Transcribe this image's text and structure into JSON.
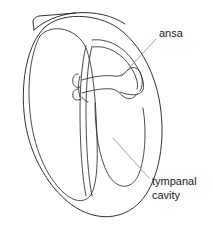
{
  "figure": {
    "name": "tympanal-organ-cross-section",
    "background_color": "#ffffff",
    "ink_color": "#1a1a1a",
    "leader_color": "#8a8a8a"
  },
  "labels": {
    "ansa": {
      "text": "ansa",
      "x": 159,
      "y": 37
    },
    "tympanal_cavity": {
      "line1": "tympanal",
      "line2": "cavity",
      "x": 152,
      "y": 185
    }
  },
  "leaders": {
    "ansa_leader": "M 156 39 L 121 77",
    "tympanal_leader": "M 149 178 L 113 138"
  },
  "shapes": {
    "body_outline": "M 44 28 C 28 44 21 78 24 112 C 27 150 46 186 72 205 C 96 222 123 220 140 202 C 157 184 165 148 161 112 C 157 74 140 44 118 28 C 96 13 60 12 44 28 Z",
    "top_flap": "M 34 30 C 44 21 58 15 74 13 C 96 11 113 16 125 24",
    "flap_edge": "M 34 30 L 33 22 C 33 19 35 17 39 16 L 76 13",
    "left_lobe": "M 40 36 C 31 52 27 82 30 112 C 33 146 46 177 64 193 C 74 202 84 203 90 196 C 96 188 98 168 97 140 C 96 100 93 66 86 48 C 78 29 52 22 40 36 Z",
    "mid_septum_left": "M 86 46 C 82 62 80 86 80 112 C 80 144 82 176 86 196",
    "mid_septum_right": "M 92 46 C 88 62 86 86 86 112 C 86 144 88 176 92 196",
    "upper_right_chamber": "M 92 40 C 108 38 124 47 134 62 C 142 74 145 84 143 90 C 140 96 130 96 120 92",
    "upper_right_inner": "M 93 47 C 107 45 121 53 130 66 C 136 75 139 84 137 89",
    "lower_right_chamber": "M 95 103 C 95 130 99 158 108 174 C 117 190 131 190 138 176 C 145 161 147 132 143 108",
    "ansa_band_upper": "M 82 80 C 94 76 106 75 114 76 C 120 77 124 74 128 70 C 132 66 137 67 140 72 C 143 78 143 86 140 91",
    "ansa_band_lower": "M 82 93 C 92 90 104 88 112 89 C 118 90 120 94 124 97 C 128 100 134 99 137 94",
    "ansa_knob": "M 78 74 C 74 74 72 78 73 83 C 74 87 77 88 80 87",
    "ansa_knob2": "M 78 89 C 74 89 72 93 73 97 C 74 100 78 101 81 99",
    "ansa_stem": "M 80 76 C 78 82 78 90 80 97",
    "ansa_foot": "M 82 97 C 84 100 86 102 88 102"
  }
}
